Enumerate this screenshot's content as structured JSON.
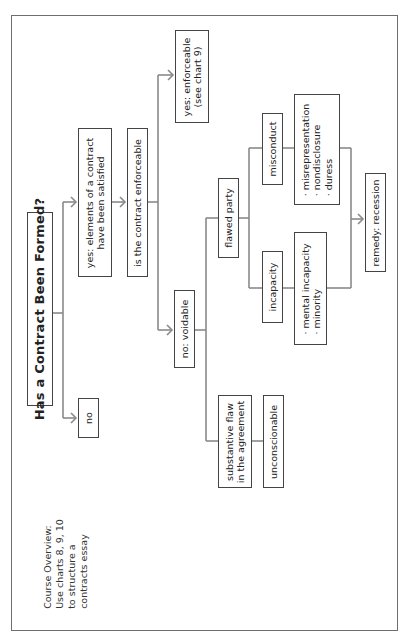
{
  "diagram": {
    "title": "Has a Contract Been Formed?",
    "orientation": "rotated 90° counter-clockwise",
    "nodes": {
      "no": "no",
      "yes_formed": {
        "line1": "yes: elements of a contract",
        "line2": "have been satisfied"
      },
      "is_enforceable": "is the contract enforceable",
      "yes_enforceable": {
        "line1": "yes: enforceable",
        "line2": "(see chart 9)"
      },
      "no_voidable": "no: voidable",
      "flawed_party": "flawed party",
      "substantive_flaw": {
        "line1": "substantive flaw",
        "line2": "in the agreement"
      },
      "unconscionable": "unconscionable",
      "misconduct": "misconduct",
      "incapacity": "incapacity",
      "misconduct_list": [
        "· misrepresentation",
        "· nondisclosure",
        "· duress"
      ],
      "incapacity_list": [
        "· mental incapacity",
        "· minority"
      ],
      "remedy": "remedy: recession"
    },
    "note": {
      "line1": "Course Overview:",
      "line2": "Use charts 8, 9, 10",
      "line3": "to structure a",
      "line4": "contracts essay"
    },
    "colors": {
      "line": "#8a8a8a",
      "border": "#444444",
      "frame": "#6e6e6e"
    }
  }
}
